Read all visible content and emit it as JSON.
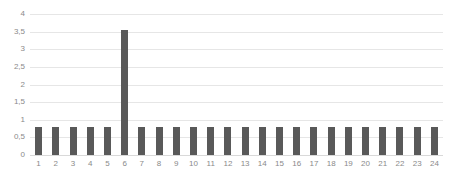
{
  "chart_data": {
    "type": "bar",
    "title": "",
    "subtitle": "",
    "xlabel": "",
    "ylabel": "",
    "categories": [
      "1",
      "2",
      "3",
      "4",
      "5",
      "6",
      "7",
      "8",
      "9",
      "10",
      "11",
      "12",
      "13",
      "14",
      "15",
      "16",
      "17",
      "18",
      "19",
      "20",
      "21",
      "22",
      "23",
      "24"
    ],
    "values": [
      0.8,
      0.8,
      0.8,
      0.8,
      0.8,
      3.55,
      0.8,
      0.8,
      0.8,
      0.8,
      0.8,
      0.8,
      0.8,
      0.8,
      0.8,
      0.8,
      0.8,
      0.8,
      0.8,
      0.8,
      0.8,
      0.8,
      0.8,
      0.8
    ],
    "ylim": [
      0,
      4
    ],
    "xlim_categories": 24,
    "y_ticks": [
      0,
      0.5,
      1,
      1.5,
      2,
      2.5,
      3,
      3.5,
      4
    ],
    "y_tick_labels": [
      "0",
      "0,5",
      "1",
      "1,5",
      "2",
      "2,5",
      "3",
      "3,5",
      "4"
    ],
    "grid": true,
    "grid_axis": "y",
    "legend": false,
    "legend_position": "none",
    "bar_color": "#595959",
    "gridline_color": "#e6e6e6",
    "axis_color": "#d9d9d9",
    "tick_label_color": "#8a8a8a",
    "background_color": "#ffffff",
    "decimal_separator": ","
  }
}
